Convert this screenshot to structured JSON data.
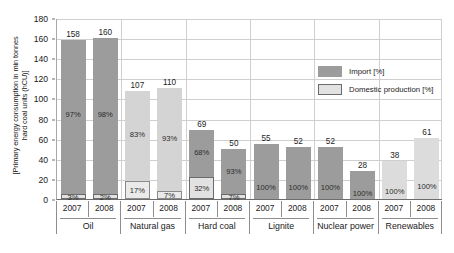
{
  "chart_data": {
    "type": "bar",
    "subtype": "stacked-bar",
    "title": "",
    "xlabel": "",
    "ylabel": "[Primary energy consumption in min tonnes\nhard coal units (hCU)]",
    "ylim": [
      0,
      180
    ],
    "yticks": [
      0,
      20,
      40,
      60,
      80,
      100,
      120,
      140,
      160,
      180
    ],
    "grid": true,
    "legend_position": "inside-upper-right",
    "legend": [
      {
        "name": "Import [%]",
        "swatch": "import"
      },
      {
        "name": "Domestic production [%]",
        "swatch": "domestic"
      }
    ],
    "groups": [
      "Oil",
      "Natural gas",
      "Hard coal",
      "Lignite",
      "Nuclear power",
      "Renewables"
    ],
    "years": [
      "2007",
      "2008"
    ],
    "bars": [
      {
        "group": "Oil",
        "year": "2007",
        "total": 158,
        "total_label": "158",
        "import_pct": 97,
        "import_label": "97%",
        "domestic_pct": 3,
        "domestic_label": "3%",
        "shade": "dark"
      },
      {
        "group": "Oil",
        "year": "2008",
        "total": 160,
        "total_label": "160",
        "import_pct": 98,
        "import_label": "98%",
        "domestic_pct": 2,
        "domestic_label": "2%",
        "shade": "dark"
      },
      {
        "group": "Natural gas",
        "year": "2007",
        "total": 107,
        "total_label": "107",
        "import_pct": 83,
        "import_label": "83%",
        "domestic_pct": 17,
        "domestic_label": "17%",
        "shade": "light"
      },
      {
        "group": "Natural gas",
        "year": "2008",
        "total": 110,
        "total_label": "110",
        "import_pct": 93,
        "import_label": "93%",
        "domestic_pct": 7,
        "domestic_label": "7%",
        "shade": "light"
      },
      {
        "group": "Hard coal",
        "year": "2007",
        "total": 69,
        "total_label": "69",
        "import_pct": 68,
        "import_label": "68%",
        "domestic_pct": 32,
        "domestic_label": "32%",
        "shade": "dark"
      },
      {
        "group": "Hard coal",
        "year": "2008",
        "total": 50,
        "total_label": "50",
        "import_pct": 93,
        "import_label": "93%",
        "domestic_pct": 7,
        "domestic_label": "7%",
        "shade": "dark"
      },
      {
        "group": "Lignite",
        "year": "2007",
        "total": 55,
        "total_label": "55",
        "import_pct": 0,
        "import_label": "",
        "domestic_pct": 100,
        "domestic_label": "100%",
        "shade": "solid-mid"
      },
      {
        "group": "Lignite",
        "year": "2008",
        "total": 52,
        "total_label": "52",
        "import_pct": 0,
        "import_label": "",
        "domestic_pct": 100,
        "domestic_label": "100%",
        "shade": "solid-mid"
      },
      {
        "group": "Nuclear power",
        "year": "2007",
        "total": 52,
        "total_label": "52",
        "import_pct": 100,
        "import_label": "100%",
        "domestic_pct": 0,
        "domestic_label": "",
        "shade": "solid-dark"
      },
      {
        "group": "Nuclear power",
        "year": "2008",
        "total": 28,
        "total_label": "28",
        "import_pct": 100,
        "import_label": "100%",
        "domestic_pct": 0,
        "domestic_label": "",
        "shade": "solid-dark"
      },
      {
        "group": "Renewables",
        "year": "2007",
        "total": 38,
        "total_label": "38",
        "import_pct": 0,
        "import_label": "",
        "domestic_pct": 100,
        "domestic_label": "100%",
        "shade": "solid-light"
      },
      {
        "group": "Renewables",
        "year": "2008",
        "total": 61,
        "total_label": "61",
        "import_pct": 0,
        "import_label": "",
        "domestic_pct": 100,
        "domestic_label": "100%",
        "shade": "solid-light"
      }
    ],
    "colors": {
      "import_dark": "#9c9c9c",
      "import_light": "#d4d4d4",
      "domestic_fill": "#e2e2e2",
      "domestic_border": "#6b6b6b",
      "grid": "#cfcfcf",
      "axis": "#6d6d6d",
      "text": "#1a1a1a",
      "background": "#ffffff"
    }
  }
}
